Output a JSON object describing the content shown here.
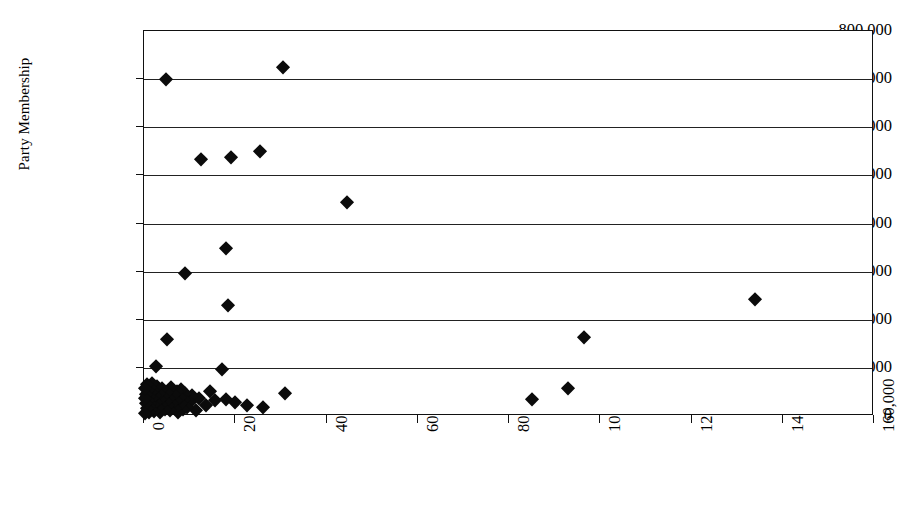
{
  "chart_data": {
    "type": "scatter",
    "title": "",
    "xlabel": "",
    "ylabel": "Party Membership",
    "xlim": [
      0,
      160000
    ],
    "ylim": [
      0,
      800000
    ],
    "xticks": [
      0,
      20000,
      40000,
      60000,
      80000,
      100000,
      120000,
      140000,
      160000
    ],
    "xtick_labels": [
      "0",
      "20,000",
      "40,000",
      "60,000",
      "80,000",
      "100,000",
      "120,000",
      "140,000",
      "160,000"
    ],
    "yticks": [
      0,
      100000,
      200000,
      300000,
      400000,
      500000,
      600000,
      700000,
      800000
    ],
    "ytick_labels": [
      "0",
      "100,000",
      "200,000",
      "300,000",
      "400,000",
      "500,000",
      "600,000",
      "700,000",
      "800,000"
    ],
    "grid": "horizontal",
    "legend": "none",
    "marker": "diamond",
    "marker_color": "#0b0b0b",
    "series": [
      {
        "name": "Parties",
        "points": [
          [
            4800,
            700000
          ],
          [
            30500,
            725000
          ],
          [
            25500,
            550000
          ],
          [
            19000,
            538000
          ],
          [
            12500,
            535000
          ],
          [
            44500,
            445000
          ],
          [
            18000,
            350000
          ],
          [
            9000,
            297000
          ],
          [
            18500,
            230000
          ],
          [
            134000,
            243000
          ],
          [
            96500,
            165000
          ],
          [
            5000,
            160000
          ],
          [
            2600,
            103000
          ],
          [
            17000,
            98000
          ],
          [
            93000,
            58000
          ],
          [
            85000,
            35000
          ],
          [
            31000,
            48000
          ],
          [
            26000,
            18000
          ],
          [
            22500,
            22000
          ],
          [
            20000,
            30000
          ],
          [
            18000,
            36000
          ],
          [
            15500,
            33000
          ],
          [
            14500,
            52000
          ],
          [
            13500,
            22000
          ],
          [
            12000,
            38000
          ],
          [
            11500,
            12000
          ],
          [
            10500,
            44000
          ],
          [
            10000,
            30000
          ],
          [
            9500,
            18000
          ],
          [
            9000,
            48000
          ],
          [
            8800,
            35000
          ],
          [
            8500,
            14000
          ],
          [
            8200,
            56000
          ],
          [
            8000,
            26000
          ],
          [
            7800,
            40000
          ],
          [
            7500,
            9000
          ],
          [
            7200,
            52000
          ],
          [
            7000,
            33000
          ],
          [
            6800,
            17000
          ],
          [
            6500,
            45000
          ],
          [
            6200,
            28000
          ],
          [
            6000,
            60000
          ],
          [
            5800,
            12000
          ],
          [
            5500,
            38000
          ],
          [
            5200,
            22000
          ],
          [
            5000,
            50000
          ],
          [
            4800,
            31000
          ],
          [
            4500,
            15000
          ],
          [
            4200,
            42000
          ],
          [
            4000,
            58000
          ],
          [
            3800,
            25000
          ],
          [
            3600,
            9000
          ],
          [
            3400,
            36000
          ],
          [
            3200,
            48000
          ],
          [
            3000,
            19000
          ],
          [
            2800,
            63000
          ],
          [
            2600,
            30000
          ],
          [
            2400,
            44000
          ],
          [
            2200,
            11000
          ],
          [
            2000,
            55000
          ],
          [
            1900,
            24000
          ],
          [
            1800,
            68000
          ],
          [
            1700,
            37000
          ],
          [
            1600,
            14000
          ],
          [
            1500,
            49000
          ],
          [
            1400,
            28000
          ],
          [
            1300,
            60000
          ],
          [
            1200,
            8000
          ],
          [
            1100,
            41000
          ],
          [
            1000,
            21000
          ],
          [
            900,
            53000
          ],
          [
            800,
            33000
          ],
          [
            700,
            66000
          ],
          [
            600,
            16000
          ],
          [
            500,
            45000
          ],
          [
            400,
            27000
          ],
          [
            300,
            6000
          ],
          [
            200,
            38000
          ],
          [
            150,
            58000
          ]
        ]
      }
    ]
  }
}
